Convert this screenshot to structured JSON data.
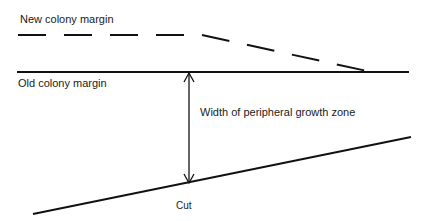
{
  "diagram": {
    "labels": {
      "new_colony_margin": "New colony margin",
      "old_colony_margin": "Old colony margin",
      "growth_zone_width": "Width of peripheral growth zone",
      "cut": "Cut"
    },
    "colors": {
      "line": "#111111",
      "text": "#1a1a1a",
      "background": "#ffffff"
    }
  }
}
